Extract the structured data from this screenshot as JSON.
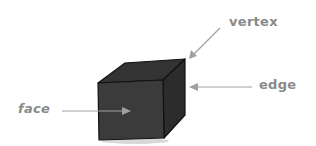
{
  "diagram": {
    "labels": {
      "vertex": "vertex",
      "edge": "edge",
      "face": "face"
    },
    "colors": {
      "cube_front": "#3b3b3b",
      "cube_top": "#333333",
      "cube_side": "#2c2c2c",
      "outline": "#111111",
      "arrow": "#a0a0a0",
      "label": "#8a8a8a",
      "background": "#ffffff"
    }
  }
}
